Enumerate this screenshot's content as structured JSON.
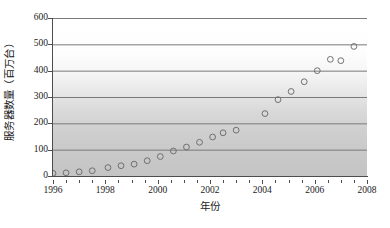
{
  "chart_data": {
    "type": "scatter",
    "title": "",
    "xlabel": "年份",
    "ylabel": "服务器数量（百万台）",
    "xlim": [
      1996,
      2008
    ],
    "ylim": [
      0,
      600
    ],
    "xticks": [
      1996,
      1998,
      2000,
      2002,
      2004,
      2006,
      2008
    ],
    "xtick_labels": [
      "1996",
      "1998",
      "2000",
      "2002",
      "2004",
      "2006",
      "2008"
    ],
    "yticks": [
      0,
      100,
      200,
      300,
      400,
      500,
      600
    ],
    "ytick_labels": [
      "0",
      "100",
      "200",
      "300",
      "400",
      "500",
      "600"
    ],
    "x_minor_tick_step": 0.5,
    "grid": "horizontal",
    "legend": "none",
    "marker": "open-circle",
    "marker_edge_color": "#707070",
    "marker_face_color": "none",
    "gridline_color": "#7a7a7a",
    "axis_color": "#4d4d4d",
    "plot_background": "vertical-gradient-white-to-gray",
    "x": [
      1996.0,
      1996.5,
      1997.0,
      1997.5,
      1998.1,
      1998.6,
      1999.1,
      1999.6,
      2000.1,
      2000.6,
      2001.1,
      2001.6,
      2002.1,
      2002.5,
      2003.0,
      2004.1,
      2004.6,
      2005.1,
      2005.6,
      2006.1,
      2006.6,
      2007.0,
      2007.5
    ],
    "y": [
      10,
      12,
      16,
      20,
      32,
      39,
      45,
      58,
      74,
      95,
      110,
      128,
      148,
      164,
      174,
      237,
      290,
      321,
      358,
      400,
      443,
      438,
      492
    ],
    "points": [
      {
        "x": 1996.0,
        "y": 10
      },
      {
        "x": 1996.5,
        "y": 12
      },
      {
        "x": 1997.0,
        "y": 16
      },
      {
        "x": 1997.5,
        "y": 20
      },
      {
        "x": 1998.1,
        "y": 32
      },
      {
        "x": 1998.6,
        "y": 39
      },
      {
        "x": 1999.1,
        "y": 45
      },
      {
        "x": 1999.6,
        "y": 58
      },
      {
        "x": 2000.1,
        "y": 74
      },
      {
        "x": 2000.6,
        "y": 95
      },
      {
        "x": 2001.1,
        "y": 110
      },
      {
        "x": 2001.6,
        "y": 128
      },
      {
        "x": 2002.1,
        "y": 148
      },
      {
        "x": 2002.5,
        "y": 164
      },
      {
        "x": 2003.0,
        "y": 174
      },
      {
        "x": 2004.1,
        "y": 237
      },
      {
        "x": 2004.6,
        "y": 290
      },
      {
        "x": 2005.1,
        "y": 321
      },
      {
        "x": 2005.6,
        "y": 358
      },
      {
        "x": 2006.1,
        "y": 400
      },
      {
        "x": 2006.6,
        "y": 443
      },
      {
        "x": 2007.0,
        "y": 438
      },
      {
        "x": 2007.5,
        "y": 492
      }
    ]
  }
}
